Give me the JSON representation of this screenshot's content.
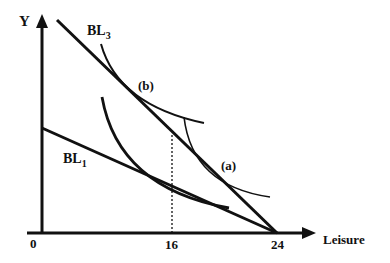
{
  "diagram": {
    "type": "labor-leisure choice (budget lines and indifference curves)",
    "axes": {
      "y_label": "Y",
      "x_label": "Leisure",
      "origin_label": "0",
      "x_ticks": [
        "16",
        "24"
      ]
    },
    "budget_lines": [
      {
        "id": "BL3",
        "label_main": "BL",
        "label_sub": "3"
      },
      {
        "id": "BL1",
        "label_main": "BL",
        "label_sub": "1"
      }
    ],
    "points": [
      {
        "id": "b",
        "label": "(b)"
      },
      {
        "id": "a",
        "label": "(a)"
      }
    ],
    "colors": {
      "ink": "#111111",
      "background": "#ffffff"
    }
  }
}
